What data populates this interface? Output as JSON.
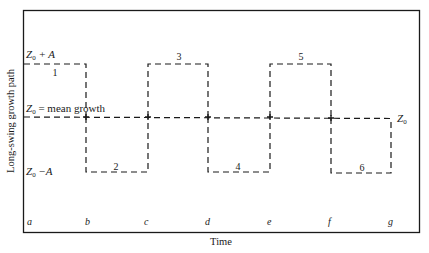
{
  "diagram": {
    "type": "square-wave long-swing growth diagram",
    "y_axis_label": "Long-swing growth path",
    "x_axis_label": "Time",
    "levels": {
      "upper": {
        "label_main": "Z",
        "label_sub": "0",
        "label_rest": " + A",
        "y": 64
      },
      "mean": {
        "label_main": "Z",
        "label_sub": "0",
        "label_rest": " = mean growth",
        "y": 117
      },
      "lower": {
        "label_main": "Z",
        "label_sub": "0",
        "label_rest": " −A",
        "y": 172
      }
    },
    "end_label": {
      "main": "Z",
      "sub": "0"
    },
    "time_points": [
      {
        "label": "a",
        "x": 24
      },
      {
        "label": "b",
        "x": 86
      },
      {
        "label": "c",
        "x": 148
      },
      {
        "label": "d",
        "x": 208
      },
      {
        "label": "e",
        "x": 270
      },
      {
        "label": "f",
        "x": 331
      },
      {
        "label": "g",
        "x": 391
      }
    ],
    "phases": [
      {
        "number": "1",
        "level": "upper",
        "from": "a",
        "to": "b"
      },
      {
        "number": "2",
        "level": "lower",
        "from": "b",
        "to": "c"
      },
      {
        "number": "3",
        "level": "upper",
        "from": "c",
        "to": "d"
      },
      {
        "number": "4",
        "level": "lower",
        "from": "d",
        "to": "e"
      },
      {
        "number": "5",
        "level": "upper",
        "from": "e",
        "to": "f"
      },
      {
        "number": "6",
        "level": "lower",
        "from": "f",
        "to": "g"
      }
    ],
    "colors": {
      "line": "#1a1a1a",
      "background": "#ffffff"
    }
  }
}
